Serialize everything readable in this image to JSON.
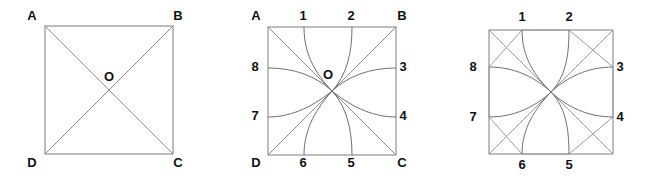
{
  "figure": {
    "title": "",
    "background_color": "#ffffff",
    "stroke_color": "#888888",
    "curve_color": "#6f6f6f",
    "label_color": "#111111",
    "panel_count": 3
  },
  "panels": [
    {
      "id": "panel-1",
      "name": "square-with-diagonals",
      "square": {
        "x": 45,
        "y": 26,
        "size": 128
      },
      "corner_labels": [
        {
          "key": "A",
          "text": "A",
          "x": 32,
          "y": 17
        },
        {
          "key": "B",
          "text": "B",
          "x": 178,
          "y": 17
        },
        {
          "key": "C",
          "text": "C",
          "x": 178,
          "y": 164
        },
        {
          "key": "D",
          "text": "D",
          "x": 32,
          "y": 164
        }
      ],
      "center_label": {
        "text": "O",
        "x": 109,
        "y": 78
      },
      "edge_labels": [],
      "has_diagonals": true,
      "has_curves": false,
      "has_corner_crosses": false
    },
    {
      "id": "panel-2",
      "name": "square-with-curved-spokes",
      "square": {
        "x": 50,
        "y": 27,
        "size": 128
      },
      "corner_labels": [
        {
          "key": "A",
          "text": "A",
          "x": 38,
          "y": 17
        },
        {
          "key": "B",
          "text": "B",
          "x": 184,
          "y": 17
        },
        {
          "key": "C",
          "text": "C",
          "x": 184,
          "y": 164
        },
        {
          "key": "D",
          "text": "D",
          "x": 38,
          "y": 164
        }
      ],
      "center_label": {
        "text": "O",
        "x": 110,
        "y": 76
      },
      "edge_labels": [
        {
          "key": "1",
          "text": "1",
          "x": 85,
          "y": 17
        },
        {
          "key": "2",
          "text": "2",
          "x": 133,
          "y": 17
        },
        {
          "key": "3",
          "text": "3",
          "x": 185,
          "y": 68
        },
        {
          "key": "4",
          "text": "4",
          "x": 185,
          "y": 117
        },
        {
          "key": "5",
          "text": "5",
          "x": 133,
          "y": 164
        },
        {
          "key": "6",
          "text": "6",
          "x": 85,
          "y": 164
        },
        {
          "key": "7",
          "text": "7",
          "x": 37,
          "y": 117
        },
        {
          "key": "8",
          "text": "8",
          "x": 37,
          "y": 68
        }
      ],
      "has_diagonals": true,
      "has_curves": true,
      "has_corner_crosses": false
    },
    {
      "id": "panel-3",
      "name": "square-with-curves-and-corner-crosses",
      "square": {
        "x": 53,
        "y": 30,
        "size": 124
      },
      "corner_labels": [],
      "center_label": {
        "text": "",
        "x": 115,
        "y": 78
      },
      "edge_labels": [
        {
          "key": "1",
          "text": "1",
          "x": 86,
          "y": 18
        },
        {
          "key": "2",
          "text": "2",
          "x": 133,
          "y": 18
        },
        {
          "key": "3",
          "text": "3",
          "x": 184,
          "y": 68
        },
        {
          "key": "4",
          "text": "4",
          "x": 184,
          "y": 118
        },
        {
          "key": "5",
          "text": "5",
          "x": 133,
          "y": 166
        },
        {
          "key": "6",
          "text": "6",
          "x": 86,
          "y": 166
        },
        {
          "key": "7",
          "text": "7",
          "x": 37,
          "y": 118
        },
        {
          "key": "8",
          "text": "8",
          "x": 37,
          "y": 68
        }
      ],
      "has_diagonals": false,
      "has_curves": true,
      "has_corner_crosses": true
    }
  ],
  "geometry_notes": {
    "edge_point_fractions": [
      0.28,
      0.72
    ],
    "spoke_count": 8,
    "convergence_point": "center O"
  }
}
